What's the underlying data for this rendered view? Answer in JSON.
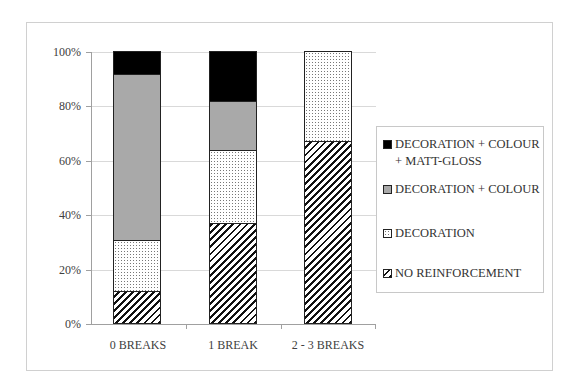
{
  "chart_data": {
    "type": "bar",
    "stacked": true,
    "percent_stacked": true,
    "title": "",
    "xlabel": "",
    "ylabel": "",
    "ylim": [
      0,
      100
    ],
    "y_ticks": [
      "0%",
      "20%",
      "40%",
      "60%",
      "80%",
      "100%"
    ],
    "grid": true,
    "legend_position": "right",
    "categories": [
      "0 BREAKS",
      "1 BREAK",
      "2 - 3 BREAKS"
    ],
    "series": [
      {
        "name": "NO REINFORCEMENT",
        "pattern": "diagonal-hatch",
        "values": [
          11.7,
          36.6,
          67.0
        ]
      },
      {
        "name": "DECORATION",
        "pattern": "dotted",
        "values": [
          19.0,
          27.0,
          33.0
        ]
      },
      {
        "name": "DECORATION + COLOUR",
        "pattern": "solid-gray",
        "color": "#a9a9a9",
        "values": [
          61.0,
          18.1,
          0.0
        ]
      },
      {
        "name": "DECORATION + COLOUR + MATT-GLOSS",
        "pattern": "solid-black",
        "color": "#000000",
        "values": [
          8.3,
          18.3,
          0.0
        ]
      }
    ]
  },
  "axis": {
    "y_labels": [
      "100%",
      "80%",
      "60%",
      "40%",
      "20%",
      "0%"
    ]
  },
  "x_labels": [
    "0 BREAKS",
    "1 BREAK",
    "2 - 3 BREAKS"
  ],
  "legend": {
    "items": [
      {
        "label": "DECORATION + COLOUR + MATT-GLOSS",
        "lines": "DECORATION + COLOUR + MATT-GLOSS"
      },
      {
        "label": "DECORATION + COLOUR"
      },
      {
        "label": "DECORATION"
      },
      {
        "label": "NO REINFORCEMENT"
      }
    ]
  }
}
